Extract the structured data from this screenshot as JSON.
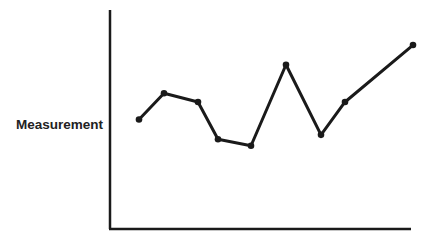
{
  "chart_data": {
    "type": "line",
    "title": "",
    "xlabel": "",
    "ylabel": "Measurement",
    "grid": false,
    "legend": null,
    "x": [
      1,
      2,
      3,
      4,
      5,
      6,
      7,
      8,
      9
    ],
    "series": [
      {
        "name": "Measurement",
        "values": [
          5.0,
          6.2,
          5.8,
          4.1,
          3.8,
          7.5,
          4.3,
          5.8,
          8.4
        ]
      }
    ],
    "ylim": [
      0,
      10
    ],
    "xlim": [
      0,
      9.2
    ],
    "line_color": "#1a1a1a"
  }
}
